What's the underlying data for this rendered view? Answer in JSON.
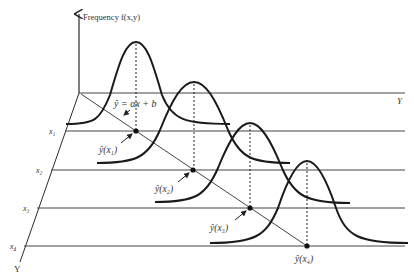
{
  "diagram": {
    "vertical_axis_label": "Frequency f(x,y)",
    "back_axis_label": "Y",
    "depth_axis_label": "Y",
    "regression_label": "ŷ = αx + b",
    "x_levels": [
      {
        "label": "x₁",
        "point_label": "ŷ(x₁)"
      },
      {
        "label": "x₂",
        "point_label": "ŷ(x₂)"
      },
      {
        "label": "x₃",
        "point_label": "ŷ(x₃)"
      },
      {
        "label": "x₄",
        "point_label": "ŷ(x₄)"
      }
    ],
    "colors": {
      "line": "#2b2b2b",
      "curve": "#1a1a1a",
      "text": "#333333"
    }
  }
}
